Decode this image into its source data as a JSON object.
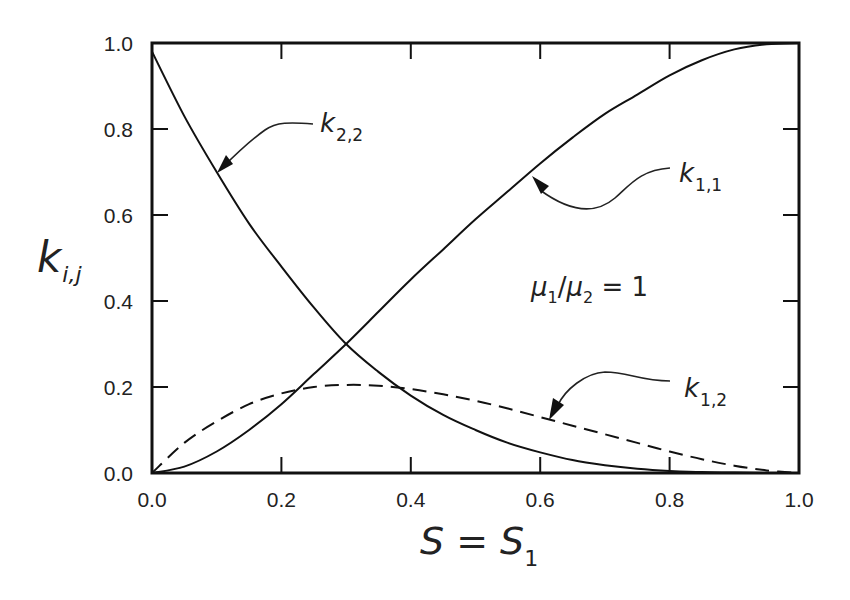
{
  "chart_data": {
    "type": "line",
    "title": "",
    "xlabel": "S = S1",
    "xlabel_main": "S = S",
    "xlabel_sub": "1",
    "ylabel": "k_{i,j}",
    "ylabel_main": "k",
    "ylabel_sub": "i,j",
    "xlim": [
      0.0,
      1.0
    ],
    "ylim": [
      0.0,
      1.0
    ],
    "x_ticks": [
      "0.0",
      "0.2",
      "0.4",
      "0.6",
      "0.8",
      "1.0"
    ],
    "y_ticks": [
      "0.0",
      "0.2",
      "0.4",
      "0.6",
      "0.8",
      "1.0"
    ],
    "grid": false,
    "legend": "none (inline arrow annotations)",
    "x": [
      0,
      0.05,
      0.1,
      0.15,
      0.2,
      0.25,
      0.3,
      0.35,
      0.4,
      0.45,
      0.5,
      0.55,
      0.6,
      0.65,
      0.7,
      0.75,
      0.8,
      0.85,
      0.9,
      0.95,
      1.0
    ],
    "series": [
      {
        "name": "k1,1",
        "style": "solid",
        "values": [
          0,
          0.015,
          0.05,
          0.1,
          0.16,
          0.23,
          0.3,
          0.375,
          0.45,
          0.52,
          0.59,
          0.655,
          0.72,
          0.78,
          0.835,
          0.88,
          0.925,
          0.96,
          0.985,
          0.997,
          1.0
        ]
      },
      {
        "name": "k2,2",
        "style": "solid",
        "values": [
          0.98,
          0.83,
          0.7,
          0.58,
          0.48,
          0.385,
          0.3,
          0.235,
          0.18,
          0.135,
          0.1,
          0.07,
          0.048,
          0.03,
          0.018,
          0.01,
          0.005,
          0.002,
          0.001,
          0,
          0
        ]
      },
      {
        "name": "k1,2",
        "style": "dashed",
        "values": [
          0,
          0.07,
          0.12,
          0.16,
          0.185,
          0.2,
          0.205,
          0.203,
          0.195,
          0.183,
          0.168,
          0.15,
          0.13,
          0.11,
          0.09,
          0.07,
          0.05,
          0.032,
          0.017,
          0.006,
          0
        ]
      }
    ],
    "annotations": [
      {
        "text": "k2,2",
        "main": "k",
        "sub": "2,2",
        "arrow_to": [
          0.1,
          0.7
        ]
      },
      {
        "text": "k1,1",
        "main": "k",
        "sub": "1,1",
        "arrow_to": [
          0.58,
          0.7
        ]
      },
      {
        "text": "k1,2",
        "main": "k",
        "sub": "1,2",
        "arrow_to": [
          0.62,
          0.12
        ]
      },
      {
        "text": "μ1/μ2 = 1",
        "mu": "μ",
        "sub1": "1",
        "slash": "/",
        "sub2": "2",
        "eq": " = 1"
      }
    ]
  }
}
